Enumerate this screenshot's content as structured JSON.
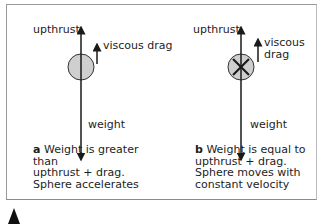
{
  "panel_a": {
    "label_upthrust": "upthrust",
    "label_drag": "viscous drag",
    "label_weight": "weight",
    "caption_letter": "a",
    "caption_line1": "Weight is greater than",
    "caption_line2": "upthrust + drag.",
    "caption_line3": "Sphere accelerates"
  },
  "panel_b": {
    "label_upthrust": "upthrust",
    "label_drag_line1": "viscous",
    "label_drag_line2": "drag",
    "label_weight": "weight",
    "caption_letter": "b",
    "caption_line1": "Weight is equal to",
    "caption_line2": "upthrust + drag.",
    "caption_line3": "Sphere moves with",
    "caption_line4": "constant velocity"
  },
  "colors": {
    "sphere_fill": "#cfcfcf",
    "line": "#1a1a1a",
    "frame": "#9a9a9a"
  }
}
